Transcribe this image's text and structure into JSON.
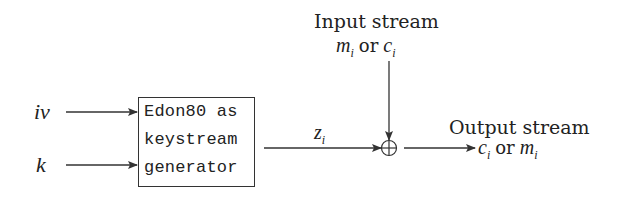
{
  "diagram": {
    "inputs": {
      "iv": "iv",
      "k": "k"
    },
    "generator_box": {
      "lines": [
        "Edon80 as",
        "keystream",
        "generator"
      ]
    },
    "keystream_label": {
      "base": "z",
      "sub": "i"
    },
    "input_stream": {
      "title": "Input stream",
      "var1": "m",
      "sub1": "i",
      "or": "or",
      "var2": "c",
      "sub2": "i"
    },
    "xor_symbol": "⊕",
    "output_stream": {
      "title": "Output stream",
      "var1": "c",
      "sub1": "i",
      "or": "or",
      "var2": "m",
      "sub2": "i"
    },
    "colors": {
      "stroke": "#333333",
      "background": "#ffffff"
    }
  }
}
